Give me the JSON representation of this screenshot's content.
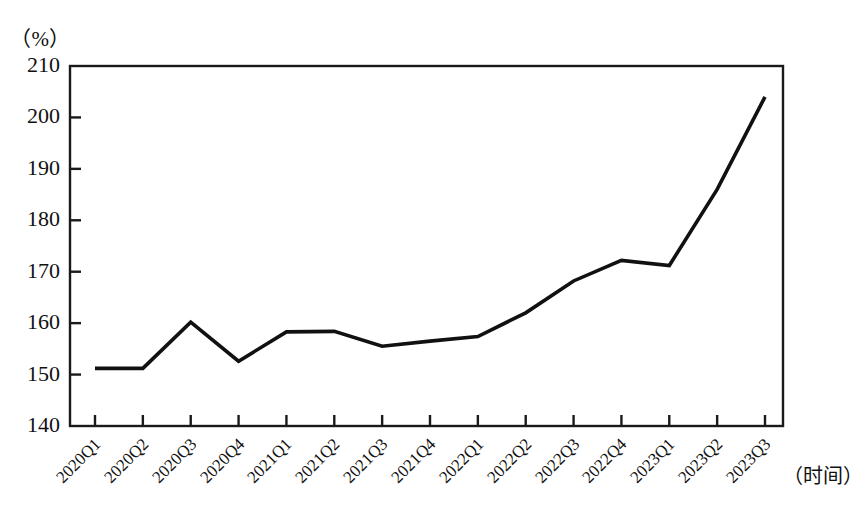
{
  "chart_data": {
    "type": "line",
    "title": "",
    "subtitle": "",
    "unit_label": "（%）",
    "xlabel": "（时间）",
    "ylabel": "",
    "categories": [
      "2020Q1",
      "2020Q2",
      "2020Q3",
      "2020Q4",
      "2021Q1",
      "2021Q2",
      "2021Q3",
      "2021Q4",
      "2022Q1",
      "2022Q2",
      "2022Q3",
      "2022Q4",
      "2023Q1",
      "2023Q2",
      "2023Q3"
    ],
    "values": [
      151.2,
      151.2,
      160.2,
      152.6,
      158.3,
      158.4,
      155.5,
      156.5,
      157.4,
      162.0,
      168.2,
      172.2,
      171.2,
      186.0,
      204.0
    ],
    "ytick_labels": [
      "210",
      "200",
      "190",
      "180",
      "170",
      "160",
      "150",
      "140"
    ],
    "yticks": [
      210,
      200,
      190,
      180,
      170,
      160,
      150,
      140
    ],
    "ylim": [
      140,
      210
    ],
    "grid": false,
    "legend": [],
    "legend_position": "none",
    "line_color": "#111111",
    "axis_color": "#1a1a1a",
    "background_color": "#ffffff"
  }
}
